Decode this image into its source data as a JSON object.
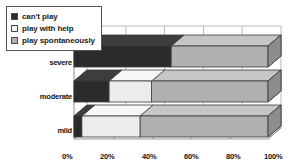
{
  "legend": {
    "items": [
      {
        "label": "can't play",
        "swatch": "#2b2b2b",
        "name": "legend-swatch-cant-play"
      },
      {
        "label": "play with help",
        "swatch": "#f2f2f2",
        "name": "legend-swatch-play-with-help"
      },
      {
        "label": "play spontaneously",
        "swatch": "#b0b0b0",
        "name": "legend-swatch-play-spontaneously"
      }
    ]
  },
  "axis": {
    "x_ticks": [
      "0%",
      "20%",
      "40%",
      "60%",
      "80%",
      "100%"
    ],
    "y_categories": [
      "severe",
      "moderate",
      "mild"
    ]
  },
  "colors": {
    "cant_play": "#2b2b2b",
    "play_with_help": "#ececec",
    "play_spontaneously": "#b0b0b0",
    "cant_play_side": "#1b1b1b",
    "play_with_help_side": "#c2c2c2",
    "play_spontaneously_side": "#8d8d8d",
    "cant_play_top": "#3d3d3d",
    "play_with_help_top": "#f7f7f7",
    "play_spontaneously_top": "#c6c6c6",
    "outline": "#3a3a3a",
    "grid": "#b9b9b9",
    "background": "#ffffff",
    "text": "#111111"
  },
  "chart_data": {
    "type": "bar",
    "orientation": "horizontal",
    "stacked": true,
    "percent_stacked": true,
    "three_d": true,
    "title": "",
    "subtitle": "",
    "xlabel": "",
    "ylabel": "",
    "xlim": [
      0,
      100
    ],
    "x_tick_labels": [
      "0%",
      "20%",
      "40%",
      "60%",
      "80%",
      "100%"
    ],
    "x_tick_values": [
      0,
      20,
      40,
      60,
      80,
      100
    ],
    "grid": true,
    "legend_position": "top-left",
    "categories": [
      "severe",
      "moderate",
      "mild"
    ],
    "series": [
      {
        "name": "can't play",
        "color": "#2b2b2b",
        "values": [
          50,
          18,
          4
        ]
      },
      {
        "name": "play with help",
        "color": "#ececec",
        "values": [
          0,
          22,
          30
        ]
      },
      {
        "name": "play spontaneously",
        "color": "#b0b0b0",
        "values": [
          50,
          60,
          66
        ]
      }
    ]
  }
}
